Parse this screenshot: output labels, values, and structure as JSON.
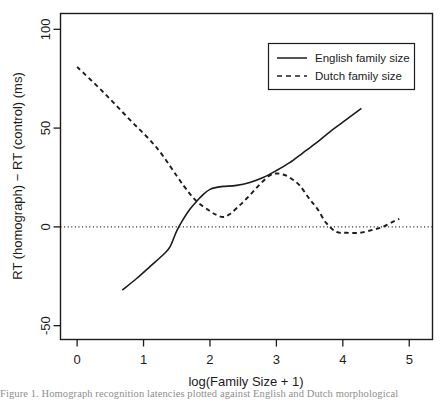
{
  "chart_data": {
    "type": "line",
    "title": "",
    "subtitle": "",
    "xlabel": "log(Family Size + 1)",
    "ylabel": "RT (homograph) − RT (control) (ms)",
    "xlim": [
      -0.25,
      5.35
    ],
    "ylim": [
      -57,
      108
    ],
    "xticks": [
      0,
      1,
      2,
      3,
      4,
      5
    ],
    "xticklabels": [
      "0",
      "1",
      "2",
      "3",
      "4",
      "5"
    ],
    "yticks": [
      -50,
      0,
      50,
      100
    ],
    "yticklabels": [
      "-50",
      "0",
      "50",
      "100"
    ],
    "grid": false,
    "reference_lines": [
      {
        "name": "zero-line",
        "orientation": "horizontal",
        "value": 0,
        "style": "dotted"
      }
    ],
    "legend": {
      "position": "top-right",
      "entries": [
        {
          "label": "English family size",
          "style": "solid"
        },
        {
          "label": "Dutch family size",
          "style": "dashed"
        }
      ]
    },
    "series": [
      {
        "name": "English family size",
        "style": "solid",
        "color": "#1c1c1c",
        "x": [
          0.68,
          0.9,
          1.1,
          1.3,
          1.4,
          1.5,
          1.6,
          1.7,
          1.8,
          1.9,
          2.0,
          2.1,
          2.2,
          2.4,
          2.6,
          2.8,
          3.0,
          3.2,
          3.4,
          3.6,
          3.8,
          4.0,
          4.28
        ],
        "y": [
          -32.0,
          -26.0,
          -20.0,
          -14.0,
          -10.0,
          -2.0,
          4.0,
          9.0,
          13.0,
          16.5,
          19.0,
          20.0,
          20.5,
          21.0,
          22.5,
          25.0,
          28.5,
          32.5,
          37.5,
          42.5,
          48.0,
          53.0,
          60.0
        ]
      },
      {
        "name": "Dutch family size",
        "style": "dashed",
        "color": "#1c1c1c",
        "x": [
          0.0,
          0.4,
          0.8,
          1.2,
          1.6,
          1.8,
          2.0,
          2.1,
          2.2,
          2.3,
          2.45,
          2.6,
          2.75,
          2.9,
          3.0,
          3.1,
          3.2,
          3.35,
          3.5,
          3.62,
          3.75,
          3.9,
          4.05,
          4.25,
          4.45,
          4.6,
          4.75,
          4.85
        ],
        "y": [
          81.0,
          68.0,
          54.0,
          40.0,
          21.0,
          13.0,
          8.0,
          6.0,
          5.0,
          6.5,
          11.0,
          16.0,
          21.5,
          26.0,
          27.0,
          26.5,
          25.0,
          21.0,
          14.0,
          9.0,
          2.0,
          -2.5,
          -3.0,
          -3.0,
          -1.5,
          0.0,
          2.5,
          4.0
        ]
      }
    ]
  },
  "figure": {
    "caption_text": "Figure 1. Homograph recognition latencies plotted against English and Dutch morphological"
  }
}
